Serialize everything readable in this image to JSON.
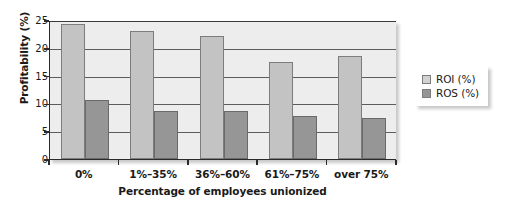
{
  "chart_data": {
    "type": "bar",
    "title": "",
    "xlabel": "Percentage of employees unionized",
    "ylabel": "Profitability (%)",
    "categories": [
      "0%",
      "1%–35%",
      "36%–60%",
      "61%–75%",
      "over 75%"
    ],
    "series": [
      {
        "name": "ROI (%)",
        "color": "#c3c3c3",
        "values": [
          24.2,
          23.1,
          22.1,
          17.4,
          18.5
        ]
      },
      {
        "name": "ROS (%)",
        "color": "#969696",
        "values": [
          10.6,
          8.7,
          8.7,
          7.8,
          7.4
        ]
      }
    ],
    "ylim": [
      0,
      25
    ],
    "yticks": [
      0,
      5,
      10,
      15,
      20,
      25
    ],
    "ytick_labels": [
      "0",
      "5",
      "10",
      "15",
      "20",
      "25"
    ],
    "grid": true,
    "grid_axis": "y",
    "legend_position": "right",
    "plot_background": "#ededed"
  },
  "legend": {
    "items": [
      {
        "label": "ROI (%)"
      },
      {
        "label": "ROS (%)"
      }
    ]
  }
}
